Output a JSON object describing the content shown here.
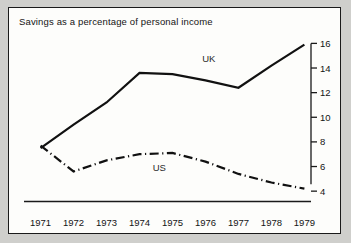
{
  "figure": {
    "title": "Savings as a percentage of personal income",
    "background": "#cfcfcc",
    "panel_background": "#fdfdfb",
    "border_color": "#1a1a1a"
  },
  "chart_data": {
    "type": "line",
    "title": "Savings as a percentage of personal income",
    "xlabel": "",
    "ylabel": "",
    "x": [
      1971,
      1972,
      1973,
      1974,
      1975,
      1976,
      1977,
      1978,
      1979
    ],
    "xtick_labels": [
      "1971",
      "1972",
      "1973",
      "1974",
      "1975",
      "1976",
      "1977",
      "1978",
      "1979"
    ],
    "ytick_labels": [
      "4",
      "6",
      "8",
      "10",
      "12",
      "14",
      "16"
    ],
    "yticks": [
      4,
      6,
      8,
      10,
      12,
      14,
      16
    ],
    "ylim": [
      3.2,
      16.6
    ],
    "xlim": [
      1970.8,
      1979.2
    ],
    "y_axis_position": "right",
    "grid": false,
    "legend": "inline-labels",
    "series": [
      {
        "name": "UK",
        "label": "UK",
        "style": "solid",
        "color": "#111111",
        "label_x": 1976.1,
        "label_y": 14.8,
        "values": [
          7.5,
          9.4,
          11.2,
          13.6,
          13.5,
          13.0,
          12.4,
          14.2,
          15.9
        ]
      },
      {
        "name": "US",
        "label": "US",
        "style": "dash-dot",
        "color": "#111111",
        "label_x": 1974.6,
        "label_y": 5.9,
        "values": [
          7.7,
          5.6,
          6.5,
          7.0,
          7.1,
          6.4,
          5.4,
          4.7,
          4.2
        ]
      }
    ]
  }
}
